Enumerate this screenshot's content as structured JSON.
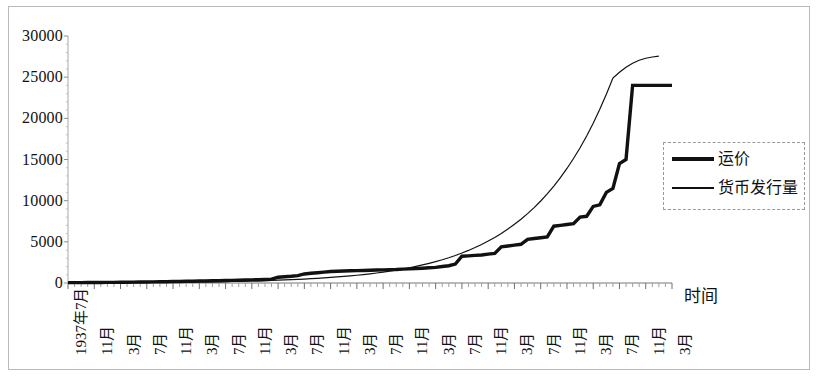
{
  "chart_data": {
    "type": "line",
    "title": "",
    "xlabel": "时间",
    "ylabel": "",
    "ylim": [
      0,
      30000
    ],
    "yticks": [
      0,
      5000,
      10000,
      15000,
      20000,
      25000,
      30000
    ],
    "ytick_labels": [
      "0",
      "5000",
      "10000",
      "15000",
      "20000",
      "25000",
      "30000"
    ],
    "grid": false,
    "legend_position": "right",
    "x_tick_labels": [
      "1937年7月",
      "11月",
      "3月",
      "7月",
      "11月",
      "3月",
      "7月",
      "11月",
      "3月",
      "7月",
      "11月",
      "3月",
      "7月",
      "11月",
      "3月",
      "7月",
      "11月",
      "3月",
      "7月",
      "11月",
      "3月",
      "7月",
      "11月",
      "3月"
    ],
    "x_tick_label_interval_months": 4,
    "x_months_total": 93,
    "series": [
      {
        "name": "运价",
        "style": "thick",
        "color": "#111111",
        "values": [
          40,
          45,
          50,
          55,
          60,
          65,
          70,
          80,
          90,
          100,
          110,
          120,
          130,
          140,
          150,
          160,
          175,
          190,
          205,
          220,
          235,
          250,
          265,
          280,
          300,
          320,
          340,
          360,
          380,
          400,
          430,
          460,
          700,
          760,
          820,
          900,
          1100,
          1180,
          1250,
          1320,
          1400,
          1420,
          1450,
          1480,
          1500,
          1520,
          1550,
          1580,
          1600,
          1620,
          1640,
          1680,
          1720,
          1760,
          1800,
          1850,
          1900,
          2000,
          2100,
          2300,
          3250,
          3300,
          3350,
          3400,
          3500,
          3600,
          4400,
          4500,
          4600,
          4700,
          5300,
          5400,
          5500,
          5600,
          6900,
          7000,
          7100,
          7200,
          8000,
          8100,
          9300,
          9500,
          11000,
          11500,
          14500,
          15000,
          24000,
          24000,
          24000,
          24000,
          24000,
          24000,
          24000
        ]
      },
      {
        "name": "货币发行量",
        "style": "thin",
        "color": "#111111",
        "values": [
          20,
          22,
          24,
          26,
          29,
          32,
          35,
          38,
          42,
          46,
          50,
          55,
          60,
          66,
          72,
          79,
          86,
          94,
          103,
          112,
          122,
          133,
          145,
          158,
          172,
          188,
          205,
          223,
          243,
          264,
          288,
          313,
          341,
          371,
          404,
          440,
          479,
          521,
          567,
          618,
          672,
          732,
          796,
          867,
          943,
          1026,
          1117,
          1215,
          1322,
          1439,
          1566,
          1704,
          1854,
          2017,
          2194,
          2387,
          2597,
          2825,
          3073,
          3343,
          3636,
          3956,
          4303,
          4681,
          5092,
          5539,
          6024,
          6552,
          7126,
          7749,
          8426,
          9162,
          9961,
          10830,
          11773,
          12798,
          13911,
          15121,
          16434,
          17861,
          19409,
          21090,
          22914,
          24892,
          25600,
          26200,
          26700,
          27050,
          27300,
          27450,
          27550
        ]
      }
    ]
  },
  "legend": {
    "items": [
      {
        "label": "运价"
      },
      {
        "label": "货币发行量"
      }
    ]
  },
  "axes": {
    "x_title": "时间"
  }
}
